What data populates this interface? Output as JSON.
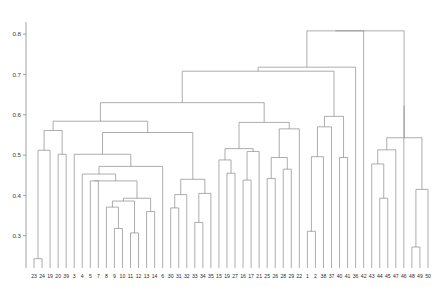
{
  "chart_data": {
    "type": "dendrogram",
    "title": "",
    "subtitle": "",
    "xlabel": "",
    "ylabel": "",
    "grid": false,
    "legend": null,
    "orientation": "vertical",
    "ylim": [
      0.22,
      0.83
    ],
    "yticks": [
      0.3,
      0.4,
      0.5,
      0.6,
      0.7,
      0.8
    ],
    "ytick_labels": [
      "0.3",
      "0.4",
      "0.5",
      "0.6",
      "0.7",
      "0.8"
    ],
    "leaf_count": 50,
    "leaf_labels": [
      "23",
      "24",
      "19",
      "20",
      "39",
      "3",
      "4",
      "5",
      "7",
      "8",
      "9",
      "10",
      "11",
      "12",
      "13",
      "14",
      "6",
      "30",
      "31",
      "32",
      "33",
      "34",
      "35",
      "15",
      "19",
      "27",
      "16",
      "17",
      "21",
      "25",
      "26",
      "28",
      "29",
      "22",
      "1",
      "2",
      "38",
      "37",
      "40",
      "41",
      "36",
      "42",
      "43",
      "44",
      "45",
      "47",
      "46",
      "48",
      "49",
      "50"
    ],
    "leaf_baseline": 0.22,
    "links": [
      {
        "id": "n1",
        "left": "23",
        "right": "24",
        "height": 0.243
      },
      {
        "id": "n2",
        "left": "n1",
        "right": "19",
        "height": 0.512
      },
      {
        "id": "n3",
        "left": "20",
        "right": "39",
        "height": 0.502
      },
      {
        "id": "n4",
        "left": "n2",
        "right": "n3",
        "height": 0.561
      },
      {
        "id": "n5",
        "left": "9",
        "right": "10",
        "height": 0.318
      },
      {
        "id": "n6",
        "left": "8",
        "right": "n5",
        "height": 0.371
      },
      {
        "id": "n7",
        "left": "11",
        "right": "12",
        "height": 0.307
      },
      {
        "id": "n8",
        "left": "n6",
        "right": "n7",
        "height": 0.386
      },
      {
        "id": "n9",
        "left": "13",
        "right": "14",
        "height": 0.36
      },
      {
        "id": "n10",
        "left": "n8",
        "right": "n9",
        "height": 0.393
      },
      {
        "id": "n11",
        "left": "5",
        "right": "7",
        "height": 0.436
      },
      {
        "id": "n12",
        "left": "n11",
        "right": "n10",
        "height": 0.436
      },
      {
        "id": "n13",
        "left": "4",
        "right": "n12",
        "height": 0.453
      },
      {
        "id": "n14",
        "left": "n13",
        "right": "6",
        "height": 0.472
      },
      {
        "id": "n15",
        "left": "3",
        "right": "n14",
        "height": 0.502
      },
      {
        "id": "n16",
        "left": "30",
        "right": "31",
        "height": 0.369
      },
      {
        "id": "n17",
        "left": "n16",
        "right": "32",
        "height": 0.402
      },
      {
        "id": "n18",
        "left": "33",
        "right": "34",
        "height": 0.333
      },
      {
        "id": "n19",
        "left": "n18",
        "right": "35",
        "height": 0.405
      },
      {
        "id": "n20",
        "left": "n17",
        "right": "n19",
        "height": 0.44
      },
      {
        "id": "n21",
        "left": "n15",
        "right": "n20",
        "height": 0.556
      },
      {
        "id": "n22",
        "left": "n4",
        "right": "n21",
        "height": 0.584
      },
      {
        "id": "n23",
        "left": "19b",
        "right": "27",
        "height": 0.455
      },
      {
        "id": "n24",
        "left": "15",
        "right": "n23",
        "height": 0.488
      },
      {
        "id": "n25",
        "left": "16",
        "right": "17",
        "height": 0.438
      },
      {
        "id": "n26",
        "left": "n25",
        "right": "21",
        "height": 0.509
      },
      {
        "id": "n27",
        "left": "n24",
        "right": "n26",
        "height": 0.516
      },
      {
        "id": "n28",
        "left": "25",
        "right": "26",
        "height": 0.442
      },
      {
        "id": "n29",
        "left": "28",
        "right": "29",
        "height": 0.465
      },
      {
        "id": "n30",
        "left": "n28",
        "right": "n29",
        "height": 0.494
      },
      {
        "id": "n31",
        "left": "n30",
        "right": "22",
        "height": 0.565
      },
      {
        "id": "n32",
        "left": "n27",
        "right": "n31",
        "height": 0.581
      },
      {
        "id": "n33",
        "left": "n22",
        "right": "n32",
        "height": 0.63
      },
      {
        "id": "n34",
        "left": "1",
        "right": "2",
        "height": 0.311
      },
      {
        "id": "n35",
        "left": "n34",
        "right": "38",
        "height": 0.496
      },
      {
        "id": "n36",
        "left": "n35",
        "right": "37",
        "height": 0.57
      },
      {
        "id": "n37",
        "left": "40",
        "right": "41",
        "height": 0.494
      },
      {
        "id": "n38",
        "left": "n36",
        "right": "n37",
        "height": 0.596
      },
      {
        "id": "n39",
        "left": "n33",
        "right": "n38",
        "height": 0.708
      },
      {
        "id": "n40",
        "left": "n39",
        "right": "36",
        "height": 0.718
      },
      {
        "id": "n41",
        "left": "44",
        "right": "45",
        "height": 0.393
      },
      {
        "id": "n42",
        "left": "43",
        "right": "n41",
        "height": 0.478
      },
      {
        "id": "n43",
        "left": "n42",
        "right": "47",
        "height": 0.513
      },
      {
        "id": "n44",
        "left": "48",
        "right": "49",
        "height": 0.272
      },
      {
        "id": "n45",
        "left": "n44",
        "right": "50",
        "height": 0.415
      },
      {
        "id": "n46",
        "left": "n43",
        "right": "n45",
        "height": 0.543
      },
      {
        "id": "n47",
        "left": "46",
        "right": "n46",
        "height": 0.622
      },
      {
        "id": "n48",
        "left": "n40",
        "right": "42",
        "height": 0.808
      },
      {
        "id": "n49",
        "left": "n48",
        "right": "n47",
        "height": 0.808
      }
    ],
    "colors": {
      "line": "#8d8d8d",
      "axis": "#8a8a8a",
      "text": "#2b2b2b",
      "background": "#ffffff"
    }
  },
  "layout": {
    "plot_left": 30,
    "plot_right": 432,
    "plot_top": 22,
    "plot_bottom": 268,
    "label_y": 278,
    "tick_len": 3
  }
}
